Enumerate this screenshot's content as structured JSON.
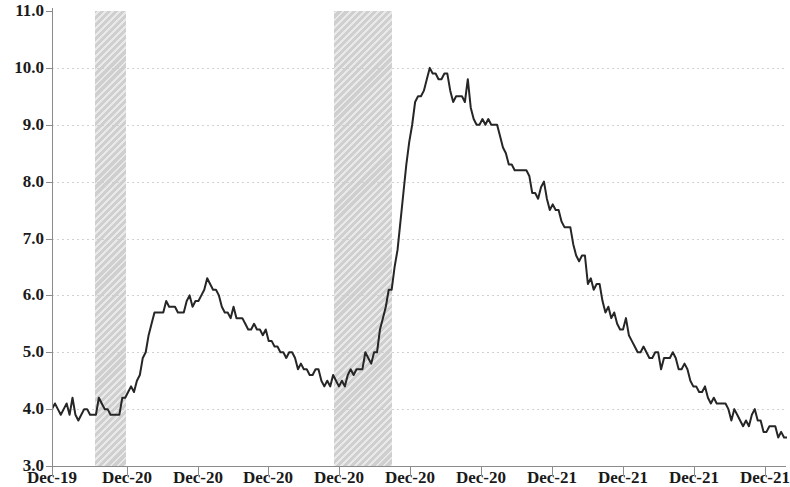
{
  "chart_data": {
    "type": "line",
    "title": "",
    "subtitle": "",
    "xlabel": "",
    "ylabel": "",
    "ylim": [
      3.0,
      11.0
    ],
    "ytick_step": 1.0,
    "yticks": [
      "3.0",
      "4.0",
      "5.0",
      "6.0",
      "7.0",
      "8.0",
      "9.0",
      "10.0",
      "11.0"
    ],
    "grid": "horizontal-dotted",
    "legend": "none",
    "xticks": [
      "Dec-19",
      "Dec-20",
      "Dec-20",
      "Dec-20",
      "Dec-20",
      "Dec-20",
      "Dec-20",
      "Dec-21",
      "Dec-21",
      "Dec-21",
      "Dec-21"
    ],
    "x_tick_positions_px": [
      52,
      127,
      198,
      268,
      339,
      410,
      481,
      552,
      623,
      694,
      765
    ],
    "series": [
      {
        "name": "Unemployment rate",
        "color": "#262626",
        "values": [
          4.0,
          4.1,
          4.0,
          3.9,
          4.0,
          4.1,
          3.9,
          4.2,
          3.9,
          3.8,
          3.9,
          4.0,
          4.0,
          3.9,
          3.9,
          3.9,
          4.2,
          4.1,
          4.0,
          4.0,
          3.9,
          3.9,
          3.9,
          3.9,
          4.2,
          4.2,
          4.3,
          4.4,
          4.3,
          4.5,
          4.6,
          4.9,
          5.0,
          5.3,
          5.5,
          5.7,
          5.7,
          5.7,
          5.7,
          5.9,
          5.8,
          5.8,
          5.8,
          5.7,
          5.7,
          5.7,
          5.9,
          6.0,
          5.8,
          5.9,
          5.9,
          6.0,
          6.1,
          6.3,
          6.2,
          6.1,
          6.1,
          6.0,
          5.8,
          5.7,
          5.7,
          5.6,
          5.8,
          5.6,
          5.6,
          5.6,
          5.5,
          5.4,
          5.4,
          5.5,
          5.4,
          5.4,
          5.3,
          5.4,
          5.2,
          5.2,
          5.1,
          5.1,
          5.0,
          5.0,
          4.9,
          5.0,
          5.0,
          4.9,
          4.7,
          4.8,
          4.7,
          4.7,
          4.6,
          4.6,
          4.7,
          4.7,
          4.5,
          4.4,
          4.5,
          4.4,
          4.6,
          4.5,
          4.4,
          4.5,
          4.4,
          4.6,
          4.7,
          4.6,
          4.7,
          4.7,
          4.7,
          5.0,
          4.9,
          4.8,
          5.0,
          5.0,
          5.4,
          5.6,
          5.8,
          6.1,
          6.1,
          6.5,
          6.8,
          7.3,
          7.8,
          8.3,
          8.7,
          9.0,
          9.4,
          9.5,
          9.5,
          9.6,
          9.8,
          10.0,
          9.9,
          9.9,
          9.8,
          9.8,
          9.9,
          9.9,
          9.6,
          9.4,
          9.5,
          9.5,
          9.5,
          9.4,
          9.8,
          9.3,
          9.1,
          9.0,
          9.0,
          9.1,
          9.0,
          9.1,
          9.0,
          9.0,
          9.0,
          8.8,
          8.6,
          8.5,
          8.3,
          8.3,
          8.2,
          8.2,
          8.2,
          8.2,
          8.2,
          8.1,
          7.8,
          7.8,
          7.7,
          7.9,
          8.0,
          7.7,
          7.5,
          7.6,
          7.5,
          7.5,
          7.3,
          7.2,
          7.2,
          7.2,
          6.9,
          6.7,
          6.6,
          6.7,
          6.7,
          6.2,
          6.3,
          6.1,
          6.2,
          6.2,
          5.9,
          5.7,
          5.8,
          5.6,
          5.7,
          5.5,
          5.4,
          5.4,
          5.6,
          5.3,
          5.2,
          5.1,
          5.0,
          5.0,
          5.1,
          5.0,
          4.9,
          4.9,
          5.0,
          5.0,
          4.7,
          4.9,
          4.9,
          4.9,
          5.0,
          4.9,
          4.7,
          4.7,
          4.8,
          4.7,
          4.5,
          4.4,
          4.4,
          4.3,
          4.3,
          4.4,
          4.2,
          4.1,
          4.2,
          4.1,
          4.1,
          4.1,
          4.1,
          4.0,
          3.8,
          4.0,
          3.9,
          3.8,
          3.7,
          3.8,
          3.7,
          3.9,
          4.0,
          3.8,
          3.8,
          3.6,
          3.6,
          3.7,
          3.7,
          3.7,
          3.5,
          3.6,
          3.5,
          3.5
        ]
      }
    ],
    "recessions": [
      {
        "name": "recession-band-1",
        "x_start_px": 95,
        "x_end_px": 126
      },
      {
        "name": "recession-band-2",
        "x_start_px": 334,
        "x_end_px": 392
      }
    ]
  }
}
